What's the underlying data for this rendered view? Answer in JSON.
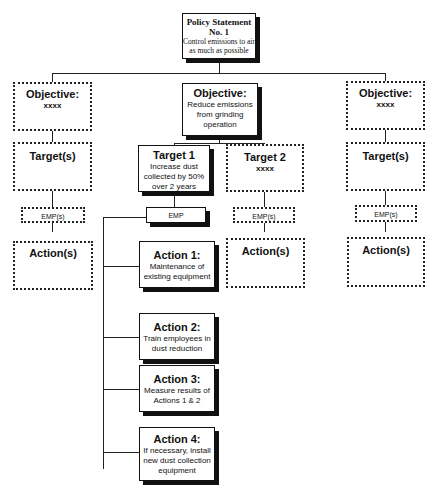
{
  "policy": {
    "title": "Policy Statement",
    "number": "No. 1",
    "text": "Control emissions to air as much as possible"
  },
  "objectives": [
    {
      "label": "Objective:",
      "text": "xxxx"
    },
    {
      "label": "Objective:",
      "text": "Reduce emissions from grinding operation"
    },
    {
      "label": "Objective:",
      "text": "xxxx"
    }
  ],
  "targets": {
    "left": {
      "label": "Target(s)"
    },
    "target1": {
      "label": "Target 1",
      "text": "Increase dust collected by 50% over 2 years"
    },
    "target2": {
      "label": "Target 2",
      "text": "xxxx"
    },
    "right": {
      "label": "Target(s)"
    }
  },
  "emps": {
    "left": "EMP(s)",
    "center": "EMP",
    "target2": "EMP(s)",
    "right": "EMP(s)"
  },
  "actions_placeholder": {
    "left": "Action(s)",
    "target2": "Action(s)",
    "right": "Action(s)"
  },
  "actions": [
    {
      "label": "Action 1:",
      "text": "Maintenance of existing equipment"
    },
    {
      "label": "Action 2:",
      "text": "Train employees in dust reduction"
    },
    {
      "label": "Action 3:",
      "text": "Measure results of Actions 1 & 2"
    },
    {
      "label": "Action 4:",
      "text": "If necessary, install new dust collection equipment"
    }
  ]
}
